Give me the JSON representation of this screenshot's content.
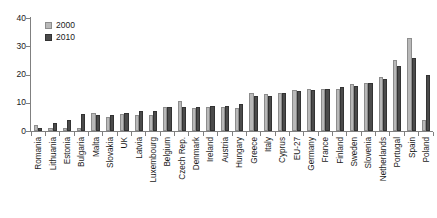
{
  "chart_data": {
    "type": "bar",
    "title": "",
    "subtitle": "",
    "xlabel": "",
    "ylabel": "",
    "ylim": [
      0,
      40
    ],
    "yticks": [
      0,
      10,
      20,
      30,
      40
    ],
    "grid": false,
    "legend_position": "top-left",
    "categories": [
      "Romania",
      "Lithuania",
      "Estonia",
      "Bulgaria",
      "Malta",
      "Slovakia",
      "UK",
      "Latvia",
      "Luxembourg",
      "Belgium",
      "Czech Rep.",
      "Denmark",
      "Ireland",
      "Austria",
      "Hungary",
      "Greece",
      "Italy",
      "Cyprus",
      "EU-27",
      "Germany",
      "France",
      "Finland",
      "Sweden",
      "Slovenia",
      "Netherlands",
      "Portugal",
      "Spain",
      "Poland"
    ],
    "series": [
      {
        "name": "2000",
        "color": "#b9b9b9",
        "values": [
          2.0,
          1.0,
          1.0,
          1.0,
          6.5,
          5.0,
          6.0,
          5.5,
          5.5,
          8.5,
          10.5,
          8.0,
          8.5,
          8.5,
          8.0,
          13.5,
          13.0,
          13.5,
          14.5,
          15.0,
          15.0,
          15.0,
          16.5,
          17.0,
          19.0,
          25.0,
          33.0,
          4.0
        ]
      },
      {
        "name": "2010",
        "color": "#4b4b4b",
        "values": [
          1.0,
          3.0,
          4.0,
          6.0,
          5.5,
          5.5,
          6.5,
          7.0,
          7.0,
          8.5,
          8.5,
          8.5,
          9.0,
          9.0,
          9.5,
          12.5,
          12.5,
          13.5,
          14.0,
          14.5,
          15.0,
          15.5,
          16.0,
          17.0,
          18.5,
          23.0,
          26.0,
          20.0
        ]
      }
    ]
  },
  "legend": {
    "entries": [
      {
        "label": "2000",
        "swatch": "legend-swatch-2000"
      },
      {
        "label": "2010",
        "swatch": "legend-swatch-2010"
      }
    ]
  },
  "axis": {
    "y_tick_labels": [
      "0",
      "10",
      "20",
      "30",
      "40"
    ]
  }
}
